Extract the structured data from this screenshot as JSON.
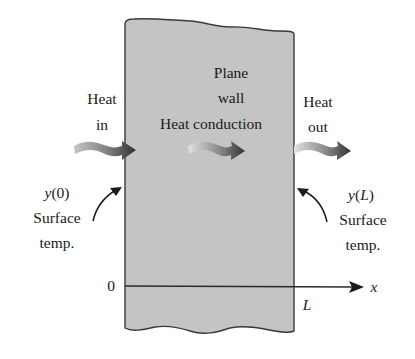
{
  "diagram": {
    "wall": {
      "label_line1": "Plane",
      "label_line2": "wall",
      "label_line3": "Heat conduction",
      "fill": "#c4c4c4",
      "stroke": "#3a3a3a"
    },
    "heat_in": {
      "line1": "Heat",
      "line2": "in"
    },
    "heat_out": {
      "line1": "Heat",
      "line2": "out"
    },
    "left_surface": {
      "symbol": "y",
      "arg": "(0)",
      "line2": "Surface",
      "line3": "temp."
    },
    "right_surface": {
      "symbol": "y",
      "arg_open": "(",
      "arg": "L",
      "arg_close": ")",
      "line2": "Surface",
      "line3": "temp."
    },
    "axis": {
      "origin_label": "0",
      "end_label": "L",
      "axis_label": "x"
    },
    "arrow_gradient": {
      "start": "#d8d8d8",
      "end": "#3a3a3a"
    }
  }
}
